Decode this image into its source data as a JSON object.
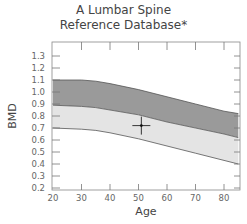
{
  "chart_data": {
    "type": "area",
    "title": "A Lumbar Spine",
    "subtitle": "Reference Database*",
    "xlabel": "Age",
    "ylabel": "BMD",
    "xlim": [
      20,
      85
    ],
    "ylim": [
      0.2,
      1.35
    ],
    "x_ticks": [
      20,
      30,
      40,
      50,
      60,
      70,
      80
    ],
    "y_ticks": [
      0.2,
      0.3,
      0.4,
      0.5,
      0.6,
      0.7,
      0.8,
      0.9,
      1.0,
      1.1,
      1.2,
      1.3
    ],
    "x": [
      20,
      30,
      35,
      40,
      50,
      60,
      70,
      80,
      85
    ],
    "series": [
      {
        "name": "upper band top",
        "values": [
          1.1,
          1.1,
          1.09,
          1.07,
          1.02,
          0.96,
          0.9,
          0.84,
          0.82
        ],
        "color": "#9a9a9a"
      },
      {
        "name": "mean line",
        "values": [
          0.89,
          0.88,
          0.87,
          0.85,
          0.81,
          0.75,
          0.7,
          0.65,
          0.62
        ],
        "color": "#e4e4e4"
      },
      {
        "name": "lower band bottom",
        "values": [
          0.7,
          0.69,
          0.68,
          0.66,
          0.61,
          0.55,
          0.49,
          0.43,
          0.4
        ]
      }
    ],
    "marker": {
      "x": 51,
      "y": 0.72,
      "shape": "crosshair"
    },
    "grid": false
  },
  "labels": {
    "title_line1": "A Lumbar Spine",
    "title_line2": "Reference Database*",
    "xlabel": "Age",
    "ylabel": "BMD"
  }
}
